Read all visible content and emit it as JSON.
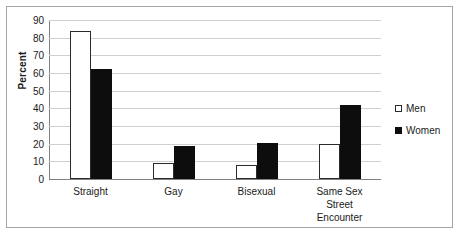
{
  "chart_data": {
    "type": "bar",
    "title": "",
    "xlabel": "",
    "ylabel": "Percent",
    "ylim": [
      0,
      90
    ],
    "ytick_step": 10,
    "yticks": [
      90,
      80,
      70,
      60,
      50,
      40,
      30,
      20,
      10,
      0
    ],
    "grid": true,
    "legend_position": "right",
    "categories": [
      "Straight",
      "Gay",
      "Bisexual",
      "Same Sex Street Encounter"
    ],
    "category_lines": [
      [
        "Straight"
      ],
      [
        "Gay"
      ],
      [
        "Bisexual"
      ],
      [
        "Same Sex",
        "Street",
        "Encounter"
      ]
    ],
    "series": [
      {
        "name": "Men",
        "color": "#ffffff",
        "edge_color": "#2b2b2b",
        "values": [
          84,
          9,
          8,
          20
        ]
      },
      {
        "name": "Women",
        "color": "#0d0d0d",
        "edge_color": "#0d0d0d",
        "values": [
          62,
          18.5,
          20.5,
          42
        ]
      }
    ]
  },
  "legend": {
    "items": [
      {
        "label": "Men"
      },
      {
        "label": "Women"
      }
    ]
  },
  "colors": {
    "border": "#a6a6a6",
    "gridline": "#d0d0d0",
    "axis": "#808080",
    "text": "#1a1a1a"
  }
}
